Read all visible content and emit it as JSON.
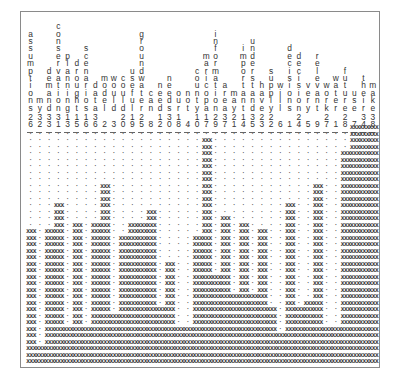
{
  "chart_data": {
    "type": "heatmap",
    "title": "",
    "xlabel": "",
    "ylabel": "",
    "categories": [
      "assumptions",
      "my",
      "demand",
      "conservation",
      "planning",
      "drought",
      "scenarios",
      "data",
      "model",
      "would",
      "could",
      "useful",
      "groundwater",
      "can",
      "need",
      "needs",
      "our",
      "not",
      "county",
      "maricopa",
      "information",
      "area",
      "may",
      "important",
      "understand",
      "have",
      "supply",
      "will",
      "decisions",
      "decision",
      "very",
      "relevant",
      "work",
      "water",
      "future",
      "use",
      "their",
      "make"
    ],
    "counts": [
      "26",
      "32",
      "33",
      "31",
      "13",
      "15",
      "16",
      "36",
      "2",
      "3",
      "20",
      "19",
      "25",
      "8",
      "12",
      "30",
      "18",
      "4",
      "10",
      "17",
      "29",
      "37",
      "21",
      "14",
      "35",
      "23",
      "22",
      "6",
      "1",
      "24",
      "5",
      "9",
      "27",
      "1",
      "28",
      "7",
      "34",
      "38"
    ],
    "heights": [
      21,
      3,
      21,
      25,
      6,
      22,
      6,
      22,
      28,
      8,
      20,
      22,
      22,
      24,
      9,
      16,
      6,
      6,
      20,
      35,
      14,
      23,
      11,
      22,
      11,
      21,
      9,
      5,
      25,
      9,
      10,
      28,
      6,
      6,
      33,
      38,
      38,
      38
    ],
    "rows": 37,
    "filled_glyph": "XXX",
    "empty_glyph": "·"
  }
}
